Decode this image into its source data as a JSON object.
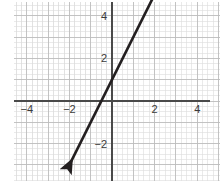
{
  "figure": {
    "kind": "coordinate-plane-line-graph",
    "width": 220,
    "height": 181,
    "background_color": "#ffffff"
  },
  "style": {
    "minor_grid_color": "#dcdcdc",
    "major_grid_color": "#bdbdbd",
    "axis_color": "#4a4a4a",
    "line_color": "#231f20",
    "tick_label_color": "#3a3a3a"
  },
  "axes": {
    "origin_px": {
      "x": 112,
      "y": 101
    },
    "unit_px": 21.3,
    "x_label": "",
    "y_label": "",
    "xlim": [
      -7.2,
      5.1
    ],
    "ylim": [
      -7.2,
      7.2
    ],
    "grid": "on",
    "minor_per_unit": 4,
    "x_ticks": [
      {
        "value": -6,
        "label": "−6"
      },
      {
        "value": -4,
        "label": "−4"
      },
      {
        "value": -2,
        "label": "−2"
      },
      {
        "value": 2,
        "label": "2"
      },
      {
        "value": 4,
        "label": "4"
      },
      {
        "value": 6,
        "label": "6"
      }
    ],
    "y_ticks": [
      {
        "value": 6,
        "label": "6"
      },
      {
        "value": 4,
        "label": "4"
      },
      {
        "value": 2,
        "label": "2"
      },
      {
        "value": -2,
        "label": "−2"
      },
      {
        "value": -4,
        "label": "−4"
      },
      {
        "value": -6,
        "label": "−6"
      }
    ]
  },
  "chart_data": {
    "type": "line",
    "title": "",
    "xlabel": "",
    "ylabel": "",
    "xlim": [
      -7.2,
      5.1
    ],
    "ylim": [
      -7.2,
      7.2
    ],
    "grid": true,
    "legend": "none",
    "series": [
      {
        "name": "line",
        "equation": "y = 2x + 1",
        "slope": 2,
        "y_intercept": 1,
        "x_intercept": -0.5,
        "color": "#231f20",
        "arrow_start": true,
        "arrow_end": true,
        "x": [
          -2.0,
          2.2
        ],
        "values": [
          -3.0,
          5.4
        ],
        "points": [
          {
            "x": -2.0,
            "y": -3.0
          },
          {
            "x": 0.0,
            "y": 1.0
          },
          {
            "x": 2.2,
            "y": 5.4
          }
        ]
      }
    ]
  }
}
